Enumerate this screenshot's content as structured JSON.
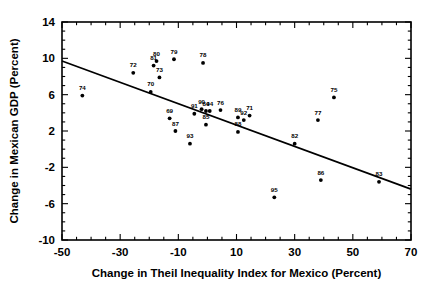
{
  "chart_data": {
    "type": "scatter",
    "title": "",
    "xlabel": "Change in Theil Inequality Index for Mexico (Percent)",
    "ylabel": "Change in Mexican GDP (Percent)",
    "xlim": [
      -50,
      70
    ],
    "ylim": [
      -10,
      14
    ],
    "xticks": [
      -50,
      -30,
      -10,
      10,
      30,
      50,
      70
    ],
    "xtick_labels": [
      "-50",
      "-30",
      "-10",
      "10",
      "30",
      "50",
      "70"
    ],
    "yticks": [
      -10,
      -6,
      -2,
      2,
      6,
      10,
      14
    ],
    "ytick_labels": [
      "-10",
      "-6",
      "-2",
      "2",
      "6",
      "10",
      "14"
    ],
    "minor_ticks": true,
    "grid": false,
    "legend": null,
    "point_label_field": "year",
    "points": [
      {
        "year": "74",
        "x": -43.0,
        "y": 5.9
      },
      {
        "year": "72",
        "x": -25.5,
        "y": 8.4
      },
      {
        "year": "80",
        "x": -17.5,
        "y": 9.7
      },
      {
        "year": "81",
        "x": -18.5,
        "y": 9.2
      },
      {
        "year": "73",
        "x": -16.5,
        "y": 7.9
      },
      {
        "year": "79",
        "x": -11.5,
        "y": 9.9
      },
      {
        "year": "70",
        "x": -19.5,
        "y": 6.3
      },
      {
        "year": "78",
        "x": -1.5,
        "y": 9.5
      },
      {
        "year": "69",
        "x": -13.0,
        "y": 3.4
      },
      {
        "year": "87",
        "x": -11.0,
        "y": 2.0
      },
      {
        "year": "93",
        "x": -6.0,
        "y": 0.6
      },
      {
        "year": "91",
        "x": -4.5,
        "y": 3.9
      },
      {
        "year": "90",
        "x": -2.0,
        "y": 4.4
      },
      {
        "year": "84",
        "x": -0.5,
        "y": 4.2
      },
      {
        "year": "94",
        "x": 0.8,
        "y": 4.2
      },
      {
        "year": "85",
        "x": -0.5,
        "y": 2.7
      },
      {
        "year": "76",
        "x": 4.5,
        "y": 4.3
      },
      {
        "year": "89",
        "x": 10.5,
        "y": 3.5
      },
      {
        "year": "92",
        "x": 12.5,
        "y": 3.2
      },
      {
        "year": "71",
        "x": 14.5,
        "y": 3.7
      },
      {
        "year": "88",
        "x": 10.5,
        "y": 1.9
      },
      {
        "year": "95",
        "x": 23.0,
        "y": -5.3
      },
      {
        "year": "82",
        "x": 30.0,
        "y": 0.6
      },
      {
        "year": "77",
        "x": 38.0,
        "y": 3.2
      },
      {
        "year": "75",
        "x": 43.5,
        "y": 5.7
      },
      {
        "year": "86",
        "x": 39.0,
        "y": -3.4
      },
      {
        "year": "83",
        "x": 59.0,
        "y": -3.6
      }
    ],
    "trend_line": {
      "type": "linear-fit",
      "x_start": -50,
      "y_start": 9.7,
      "x_end": 70,
      "y_end": -4.4
    }
  }
}
